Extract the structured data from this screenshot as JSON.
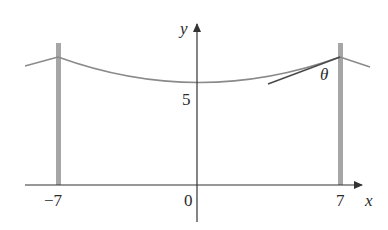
{
  "figure": {
    "labels": {
      "y_axis": "y",
      "x_axis": "x",
      "y_tick": "5",
      "x_ticks": [
        "−7",
        "0",
        "7"
      ],
      "angle": "θ"
    },
    "colors": {
      "axis": "#333333",
      "cable": "#8a8a8a",
      "pole": "#a6a6a6",
      "tangent": "#4a4a4a"
    },
    "geometry": {
      "pole_positions_x": [
        -7,
        7
      ],
      "cable_min_y": 5
    }
  }
}
